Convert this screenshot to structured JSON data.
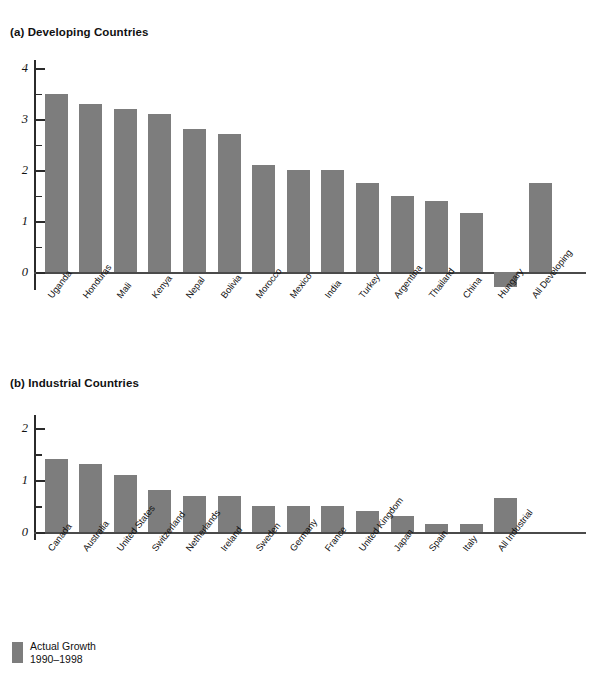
{
  "legend": {
    "label": "Actual Growth\n1990–1998",
    "swatch_color": "#7d7d7d"
  },
  "panels": [
    {
      "title": "(a) Developing Countries",
      "ytick_labels": [
        "4",
        "3",
        "2",
        "1",
        "0"
      ]
    },
    {
      "title": "(b) Industrial Countries",
      "ytick_labels": [
        "2",
        "1",
        "0"
      ]
    }
  ],
  "chart_data": [
    {
      "type": "bar",
      "title": "(a) Developing Countries",
      "xlabel": "",
      "ylabel": "",
      "ylim": [
        -0.5,
        4.2
      ],
      "yticks": [
        0,
        1,
        2,
        3,
        4
      ],
      "yminorticks": [
        0.5,
        1.5,
        2.5,
        3.5
      ],
      "grid": false,
      "legend": "Actual Growth 1990–1998",
      "legend_position": "bottom-left",
      "bar_color": "#7d7d7d",
      "categories": [
        "Uganda",
        "Honduras",
        "Mali",
        "Kenya",
        "Nepal",
        "Bolivia",
        "Morocco",
        "Mexico",
        "India",
        "Turkey",
        "Argentina",
        "Thailand",
        "China",
        "Hungary",
        "All Developing"
      ],
      "values": [
        3.5,
        3.3,
        3.2,
        3.1,
        2.8,
        2.7,
        2.1,
        2.0,
        2.0,
        1.75,
        1.5,
        1.4,
        1.15,
        -0.3,
        1.75
      ]
    },
    {
      "type": "bar",
      "title": "(b) Industrial Countries",
      "xlabel": "",
      "ylabel": "",
      "ylim": [
        0,
        2.2
      ],
      "yticks": [
        0,
        1,
        2
      ],
      "yminorticks": [
        0.5,
        1.5
      ],
      "grid": false,
      "legend": "Actual Growth 1990–1998",
      "legend_position": "bottom-left",
      "bar_color": "#7d7d7d",
      "categories": [
        "Canada",
        "Australia",
        "United States",
        "Switzerland",
        "Netherlands",
        "Ireland",
        "Sweden",
        "Germany",
        "France",
        "United Kingdom",
        "Japan",
        "Spain",
        "Italy",
        "All Industrial"
      ],
      "values": [
        1.4,
        1.3,
        1.1,
        0.8,
        0.7,
        0.7,
        0.5,
        0.5,
        0.5,
        0.4,
        0.3,
        0.15,
        0.15,
        0.65
      ]
    }
  ]
}
